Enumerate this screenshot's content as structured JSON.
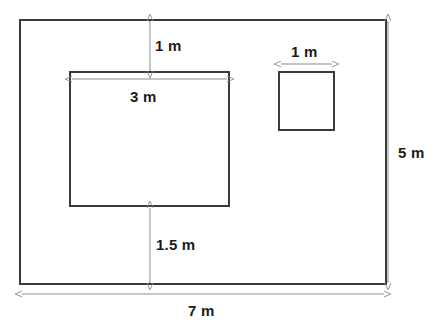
{
  "diagram": {
    "kind": "floor-plan-dimension-drawing",
    "units": "m",
    "colors": {
      "shape_stroke": "#3a3a3a",
      "dimension_stroke": "#8c8c8c",
      "label_color": "#1b1b1b",
      "background": "#ffffff"
    },
    "shapes": {
      "outer_rectangle": {
        "name": "outer-room",
        "x": 20,
        "y": 20,
        "width": 366,
        "height": 264,
        "width_m": 7,
        "height_m": 5
      },
      "inner_rectangle": {
        "name": "large-inner-block",
        "x": 70,
        "y": 72,
        "width": 159,
        "height": 134,
        "width_m": 3
      },
      "small_square": {
        "name": "small-square-block",
        "x": 279,
        "y": 72,
        "width": 55,
        "height": 58,
        "width_m": 1
      }
    },
    "dimensions": [
      {
        "id": "top-gap",
        "label": "1 m",
        "orientation": "vertical",
        "x": 150,
        "y1": 20,
        "y2": 72,
        "label_x": 155,
        "label_y": 38
      },
      {
        "id": "inner-width",
        "label": "3 m",
        "orientation": "horizontal",
        "y": 79,
        "x1": 71,
        "x2": 228,
        "label_x": 130,
        "label_y": 89
      },
      {
        "id": "bottom-gap",
        "label": "1.5 m",
        "orientation": "vertical",
        "x": 150,
        "y1": 207,
        "y2": 284,
        "label_x": 156,
        "label_y": 237
      },
      {
        "id": "square-width",
        "label": "1 m",
        "orientation": "horizontal",
        "y": 64,
        "x1": 280,
        "x2": 333,
        "label_x": 291,
        "label_y": 44
      },
      {
        "id": "overall-height",
        "label": "5 m",
        "orientation": "vertical",
        "x": 388,
        "y1": 20,
        "y2": 284,
        "label_x": 398,
        "label_y": 145
      },
      {
        "id": "overall-width",
        "label": "7 m",
        "orientation": "horizontal",
        "y": 294,
        "x1": 21,
        "x2": 385,
        "label_x": 188,
        "label_y": 303
      }
    ]
  },
  "labels": {
    "top_gap": "1 m",
    "inner_width": "3 m",
    "bottom_gap": "1.5 m",
    "square_width": "1 m",
    "overall_height": "5 m",
    "overall_width": "7 m"
  }
}
